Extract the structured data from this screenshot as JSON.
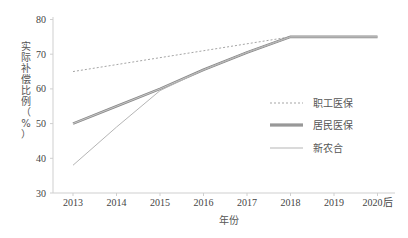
{
  "chart_data": {
    "type": "line",
    "title": "",
    "xlabel": "年份",
    "ylabel": "实际补偿比例（%）",
    "categories": [
      "2013",
      "2014",
      "2015",
      "2016",
      "2017",
      "2018",
      "2019",
      "2020后"
    ],
    "ylim": [
      30,
      80
    ],
    "yticks": [
      30,
      40,
      50,
      60,
      70,
      80
    ],
    "grid": false,
    "legend_position": "right-center",
    "series": [
      {
        "name": "职工医保",
        "style": "dotted",
        "color": "#9a9a9a",
        "values": [
          65,
          67,
          69,
          71,
          73,
          75,
          75,
          75
        ]
      },
      {
        "name": "居民医保",
        "style": "thick-double",
        "color": "#7a7a7a",
        "values": [
          50,
          55,
          60,
          65.5,
          70.5,
          75,
          75,
          75
        ]
      },
      {
        "name": "新农合",
        "style": "thin",
        "color": "#b5b5b5",
        "values": [
          38,
          49,
          59.5,
          65.5,
          70.5,
          75,
          75,
          75
        ]
      }
    ]
  },
  "axes": {
    "y_tick_labels": [
      "80",
      "70",
      "60",
      "50",
      "40",
      "30"
    ],
    "x_tick_labels": [
      "2013",
      "2014",
      "2015",
      "2016",
      "2017",
      "2018",
      "2019",
      "2020后"
    ],
    "x_title": "年份",
    "y_title_chars": [
      "实",
      "际",
      "补",
      "偿",
      "比",
      "例",
      "（",
      "%",
      "）"
    ]
  },
  "legend": {
    "items": [
      {
        "label": "职工医保"
      },
      {
        "label": "居民医保"
      },
      {
        "label": "新农合"
      }
    ]
  }
}
